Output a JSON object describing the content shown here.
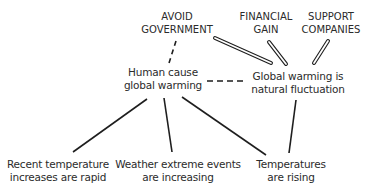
{
  "diagram": {
    "type": "argument-map",
    "nodes": {
      "avoid_government": {
        "line1": "AVOID",
        "line2": "GOVERNMENT",
        "x": 177,
        "y": 10
      },
      "financial_gain": {
        "line1": "FINANCIAL",
        "line2": "GAIN",
        "x": 266,
        "y": 10
      },
      "support_companies": {
        "line1": "SUPPORT",
        "line2": "COMPANIES",
        "x": 331,
        "y": 10
      },
      "human_cause": {
        "line1": "Human cause",
        "line2": "global warming",
        "x": 163,
        "y": 65
      },
      "natural_fluctuation": {
        "line1": "Global warming is",
        "line2": "natural fluctuation",
        "x": 298,
        "y": 69
      },
      "recent_rapid": {
        "line1": "Recent temperature",
        "line2": "increases are rapid",
        "x": 58,
        "y": 157
      },
      "weather_extremes": {
        "line1": "Weather extreme events",
        "line2": "are increasing",
        "x": 178,
        "y": 157
      },
      "temperatures_rising": {
        "line1": "Temperatures",
        "line2": "are rising",
        "x": 291,
        "y": 157
      }
    },
    "edges": [
      {
        "from": "avoid_government",
        "to": "human_cause",
        "style": "dashed"
      },
      {
        "from": "human_cause",
        "to": "natural_fluctuation",
        "style": "dashed"
      },
      {
        "from": "avoid_government",
        "to": "natural_fluctuation",
        "style": "double"
      },
      {
        "from": "financial_gain",
        "to": "natural_fluctuation",
        "style": "double"
      },
      {
        "from": "support_companies",
        "to": "natural_fluctuation",
        "style": "double"
      },
      {
        "from": "recent_rapid",
        "to": "human_cause",
        "style": "solid"
      },
      {
        "from": "weather_extremes",
        "to": "human_cause",
        "style": "solid"
      },
      {
        "from": "temperatures_rising",
        "to": "human_cause",
        "style": "solid"
      },
      {
        "from": "temperatures_rising",
        "to": "natural_fluctuation",
        "style": "solid"
      }
    ],
    "colors": {
      "line": "#1e1e1e",
      "text": "#2b2b2b",
      "background": "#ffffff"
    }
  }
}
